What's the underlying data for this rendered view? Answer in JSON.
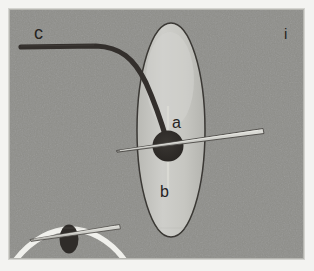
{
  "figure": {
    "panel_label": "i",
    "modality": "grayscale-ultrasound-schematic",
    "background_color": "#8f8f8b",
    "frame_color": "#f3f3f1",
    "frame": {
      "x": 9,
      "y": 9,
      "width": 295,
      "height": 250
    },
    "canvas": {
      "width": 314,
      "height": 271
    }
  },
  "labels": {
    "a": "a",
    "b": "b",
    "c": "c",
    "panel": "i"
  },
  "annotations": [
    {
      "id": "a",
      "text": "a",
      "x": 178,
      "y": 123,
      "target": "target-lesion-top"
    },
    {
      "id": "b",
      "text": "b",
      "x": 166,
      "y": 192,
      "target": "target-lesion-bottom"
    },
    {
      "id": "c",
      "text": "c",
      "x": 34,
      "y": 33,
      "target": "catheter-curve"
    },
    {
      "id": "i",
      "text": "i",
      "x": 288,
      "y": 35,
      "target": "panel-identifier"
    }
  ],
  "structures": {
    "ellipse": {
      "name": "vertical-oval-structure",
      "cx": 171,
      "cy": 130,
      "rx": 34,
      "ry": 107,
      "fill": "#c9c9c4",
      "stroke": "#3a3834",
      "stroke_width": 1.4
    },
    "lesion": {
      "name": "dark-round-target",
      "cx": 168,
      "cy": 146,
      "r": 15,
      "fill": "#2f2c29"
    },
    "catheter": {
      "name": "curved-dark-catheter",
      "color": "#332f2c",
      "width": 5,
      "start": {
        "x": 21,
        "y": 47
      },
      "end": {
        "x": 167,
        "y": 141
      }
    },
    "needle_main": {
      "name": "needle-probe-main",
      "tip": {
        "x": 116,
        "y": 150
      },
      "tail": {
        "x": 264,
        "y": 130
      },
      "fill": "#d2d2cd",
      "stroke": "#4a4744"
    },
    "needle_inset": {
      "name": "needle-probe-inset",
      "tip": {
        "x": 30,
        "y": 239
      },
      "tail": {
        "x": 120,
        "y": 226
      },
      "fill": "#d2d2cd",
      "stroke": "#4a4744"
    },
    "inset_lesion": {
      "name": "inset-dark-target",
      "cx": 69,
      "cy": 239,
      "rx": 9,
      "ry": 14,
      "fill": "#2f2c29"
    },
    "white_arc": {
      "name": "bright-acoustic-arc",
      "color": "#f0f0ec",
      "width": 5
    },
    "midline": {
      "name": "vertical-midline-trace",
      "color": "#d8d8d2",
      "x": 168,
      "y1": 108,
      "y2": 190
    }
  },
  "colors": {
    "background_gray": "#8f8f8b",
    "ellipse_fill": "#c9c9c4",
    "lesion_dark": "#2f2c29",
    "needle_light": "#d2d2cd",
    "arc_white": "#f0f0ec",
    "frame_white": "#f3f3f1",
    "text_dark": "#26231f"
  }
}
